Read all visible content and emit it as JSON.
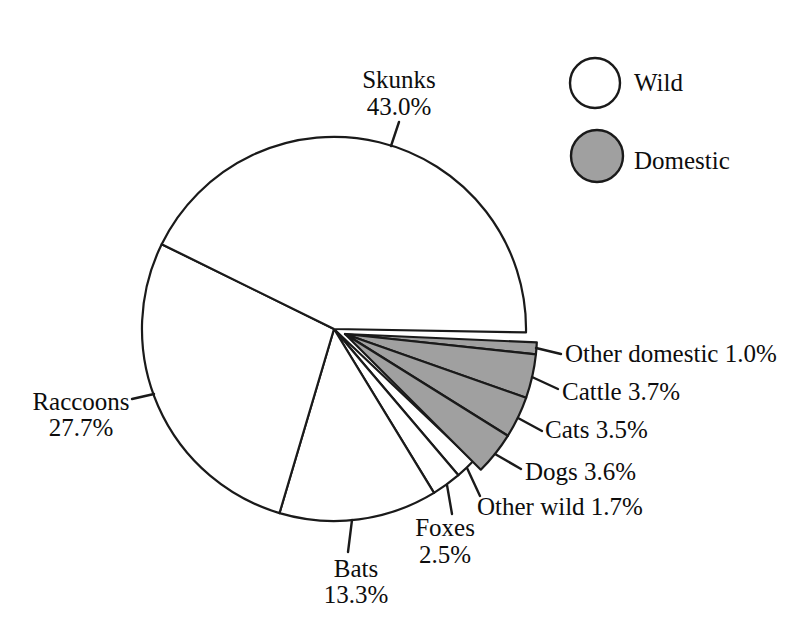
{
  "chart_data": {
    "type": "pie",
    "title": "",
    "unit": "%",
    "legend": [
      {
        "label": "Wild",
        "color": "#ffffff"
      },
      {
        "label": "Domestic",
        "color": "#a0a0a0"
      }
    ],
    "slices": [
      {
        "label": "Other domestic",
        "value": 1.0,
        "group": "Domestic"
      },
      {
        "label": "Cattle",
        "value": 3.7,
        "group": "Domestic"
      },
      {
        "label": "Cats",
        "value": 3.5,
        "group": "Domestic"
      },
      {
        "label": "Dogs",
        "value": 3.6,
        "group": "Domestic"
      },
      {
        "label": "Other wild",
        "value": 1.7,
        "group": "Wild"
      },
      {
        "label": "Foxes",
        "value": 2.5,
        "group": "Wild"
      },
      {
        "label": "Bats",
        "value": 13.3,
        "group": "Wild"
      },
      {
        "label": "Raccoons",
        "value": 27.7,
        "group": "Wild"
      },
      {
        "label": "Skunks",
        "value": 43.0,
        "group": "Wild"
      }
    ],
    "layout": {
      "canvas": [
        799,
        624
      ],
      "center": [
        334,
        329
      ],
      "radius": 192,
      "start_angle_deg": 1,
      "direction": "clockwise",
      "grid": false,
      "legend_position": "top-right",
      "explode_group": "Domestic",
      "explode_offset": [
        11,
        5
      ],
      "group_rotate_deg": 1.5,
      "stroke_color": "#1a1a1a",
      "slice_stroke_width": 2.2,
      "tick_stroke_width": 2.4,
      "labels": [
        {
          "slice": "Other domestic",
          "mode": "inline",
          "x": 565,
          "y": 362,
          "tick": [
            536,
            348,
            561,
            354
          ]
        },
        {
          "slice": "Cattle",
          "mode": "inline",
          "x": 562,
          "y": 400,
          "tick": [
            532,
            377,
            558,
            389
          ]
        },
        {
          "slice": "Cats",
          "mode": "inline",
          "x": 545,
          "y": 438,
          "tick": [
            518,
            418,
            542,
            431
          ]
        },
        {
          "slice": "Dogs",
          "mode": "inline",
          "x": 525,
          "y": 480,
          "tick": [
            495,
            454,
            521,
            469
          ]
        },
        {
          "slice": "Other wild",
          "mode": "inline",
          "x": 477,
          "y": 515,
          "tick": [
            467,
            468,
            480,
            496
          ]
        },
        {
          "slice": "Foxes",
          "mode": "stacked",
          "x": 445,
          "y": 536,
          "y2": 563,
          "tick": [
            447,
            485,
            452,
            514
          ]
        },
        {
          "slice": "Bats",
          "mode": "stacked",
          "x": 356,
          "y": 577,
          "y2": 603,
          "tick": [
            352,
            520,
            348,
            552
          ]
        },
        {
          "slice": "Raccoons",
          "mode": "stacked",
          "x": 81,
          "y": 410,
          "y2": 436,
          "tick": [
            154,
            394,
            132,
            399
          ]
        },
        {
          "slice": "Skunks",
          "mode": "stacked",
          "x": 399,
          "y": 88,
          "y2": 115,
          "tick": [
            391,
            146,
            399,
            122
          ]
        }
      ],
      "legend_layout": {
        "swatches": [
          [
            595,
            83,
            25
          ],
          [
            597,
            156,
            26
          ]
        ],
        "labels": [
          [
            634,
            91
          ],
          [
            634,
            169
          ]
        ]
      }
    }
  }
}
